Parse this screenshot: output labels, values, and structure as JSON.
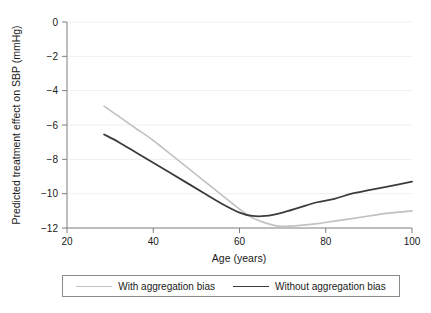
{
  "chart_data": {
    "type": "line",
    "title": "",
    "xlabel": "Age (years)",
    "ylabel": "Predicted treatment effect on SBP (mmHg)",
    "xlim": [
      20,
      100
    ],
    "ylim": [
      -12,
      0
    ],
    "xticks": [
      "20",
      "40",
      "60",
      "80",
      "100"
    ],
    "xtick_values": [
      20,
      40,
      60,
      80,
      100
    ],
    "yticks": [
      "0",
      "−2",
      "−4",
      "−6",
      "−8",
      "−10",
      "−12"
    ],
    "ytick_values": [
      0,
      -2,
      -4,
      -6,
      -8,
      -10,
      -12
    ],
    "grid": "horizontal",
    "legend_position": "below-plot",
    "series": [
      {
        "name": "With aggregation bias",
        "color": "#c2c2c2",
        "x": [
          28.6,
          32,
          36,
          40,
          44,
          48,
          52,
          56,
          60,
          63,
          66,
          68,
          70,
          74,
          78,
          82,
          86,
          90,
          94,
          100
        ],
        "values": [
          -4.9,
          -5.5,
          -6.2,
          -6.9,
          -7.7,
          -8.5,
          -9.3,
          -10.1,
          -10.9,
          -11.4,
          -11.7,
          -11.85,
          -11.9,
          -11.85,
          -11.75,
          -11.6,
          -11.45,
          -11.3,
          -11.15,
          -11.0
        ]
      },
      {
        "name": "Without aggregation bias",
        "color": "#3c3c3c",
        "x": [
          28.6,
          32,
          36,
          40,
          44,
          48,
          52,
          56,
          60,
          63,
          66,
          70,
          74,
          78,
          82,
          86,
          90,
          94,
          100
        ],
        "values": [
          -6.55,
          -7.0,
          -7.6,
          -8.2,
          -8.8,
          -9.4,
          -10.0,
          -10.6,
          -11.1,
          -11.3,
          -11.3,
          -11.1,
          -10.8,
          -10.5,
          -10.3,
          -10.0,
          -9.8,
          -9.6,
          -9.3
        ]
      }
    ]
  },
  "legend": {
    "items": [
      {
        "label": "With aggregation bias",
        "color": "#c2c2c2"
      },
      {
        "label": "Without aggregation bias",
        "color": "#3c3c3c"
      }
    ]
  },
  "axes": {
    "axis_color": "#7d7d7d",
    "grid_color": "#efefef"
  }
}
